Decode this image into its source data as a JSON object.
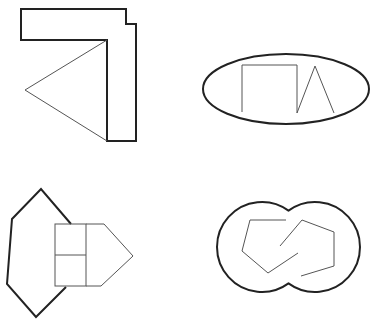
{
  "figures": [
    {
      "name": "figure-top-left",
      "description": "L-shaped block with triangle attached",
      "outer_polygon": "21,9 126,9 126,24 136,24 136,141 107,141 107,40 21,40",
      "triangle": "107,40 25,90 107,141"
    },
    {
      "name": "figure-top-right",
      "description": "Ellipse containing open rectangle and triangle strokes",
      "ellipse": {
        "cx": 286,
        "cy": 89,
        "rx": 83,
        "ry": 35
      },
      "polyline": "242,112 242,65 297,65 297,113 315,66 334,113"
    },
    {
      "name": "figure-bottom-left",
      "description": "Hexagon overlapping a house-shaped pentagon split into cells",
      "hexagon": "71,224 41,189 12,219 7,284 36,317 66,287",
      "rect": {
        "x": 55,
        "y": 224,
        "w": 31,
        "h": 62
      },
      "mid_line_y": 255,
      "pentagon": "86,224 104,224 133,256 101,286 86,286"
    },
    {
      "name": "figure-bottom-right",
      "description": "Two overlapping circles with two interlocking open polylines",
      "circles": [
        {
          "cx": 262,
          "cy": 247,
          "r": 45
        },
        {
          "cx": 315,
          "cy": 247,
          "r": 45
        }
      ],
      "polyline_left": "286,220 250,220 242,251 268,273 298,253",
      "polyline_right": "280,246 302,220 334,232 334,266 301,276"
    }
  ],
  "colors": {
    "stroke_dark": "#222222",
    "stroke_light": "#555555",
    "background": "#ffffff"
  }
}
